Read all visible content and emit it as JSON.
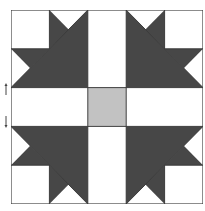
{
  "diagram": {
    "type": "quilt-block",
    "grid_units": 5,
    "colors": {
      "dark": "#474747",
      "light": "#ffffff",
      "center": "#c2c2c2",
      "outline": "#3a3a3a"
    },
    "regions": {
      "corner_squares": 4,
      "large_dark_triangles": 4,
      "small_dark_triangles": 8,
      "cross_bars": 4,
      "center_square": 1
    }
  },
  "markers": {
    "left_up_arrow": "arrow-up-icon",
    "left_down_arrow": "arrow-down-icon"
  }
}
